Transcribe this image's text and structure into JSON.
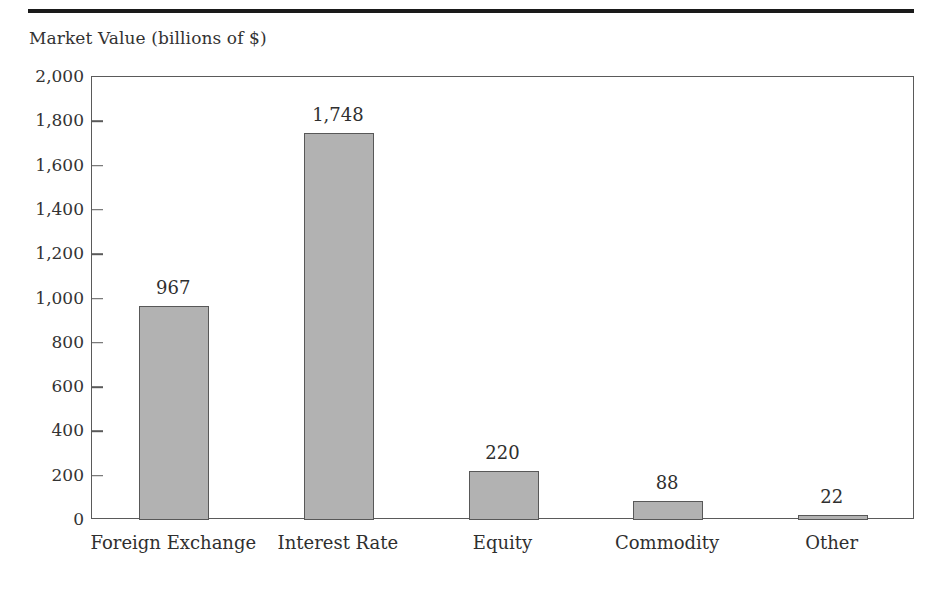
{
  "chart_data": {
    "type": "bar",
    "title": "",
    "subtitle": "",
    "xlabel": "",
    "ylabel": "Market Value (billions of $)",
    "categories": [
      "Foreign Exchange",
      "Interest Rate",
      "Equity",
      "Commodity",
      "Other"
    ],
    "values": [
      967,
      1748,
      220,
      88,
      22
    ],
    "value_labels": [
      "967",
      "1,748",
      "220",
      "88",
      "22"
    ],
    "ylim": [
      0,
      2000
    ],
    "ytick_values": [
      0,
      200,
      400,
      600,
      800,
      1000,
      1200,
      1400,
      1600,
      1800,
      2000
    ],
    "ytick_labels": [
      "0",
      "200",
      "400",
      "600",
      "800",
      "1,000",
      "1,200",
      "1,400",
      "1,600",
      "1,800",
      "2,000"
    ],
    "grid": false,
    "legend": null,
    "legend_position": "none",
    "bar_fill_color": "#b2b2b2",
    "bar_edge_color": "#585858",
    "axis_color": "#5a5a5a",
    "rule_color": "#1a1a1a"
  }
}
